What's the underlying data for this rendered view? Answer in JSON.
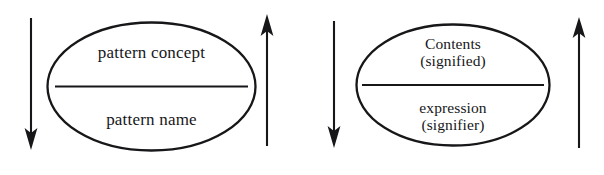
{
  "figure": {
    "background_color": "#ffffff",
    "ink_color": "#17171a",
    "width": 604,
    "height": 175
  },
  "units": [
    {
      "id": "pattern-unit",
      "ellipse": {
        "top_compartment": {
          "lines": [
            "pattern concept"
          ]
        },
        "bottom_compartment": {
          "lines": [
            "pattern name"
          ]
        }
      },
      "arrows": [
        {
          "name": "left-down-arrow",
          "direction": "down"
        },
        {
          "name": "right-up-arrow",
          "direction": "up"
        }
      ]
    },
    {
      "id": "sign-unit",
      "ellipse": {
        "top_compartment": {
          "lines": [
            "Contents",
            "(signified)"
          ]
        },
        "bottom_compartment": {
          "lines": [
            "expression",
            "(signifier)"
          ]
        }
      },
      "arrows": [
        {
          "name": "left-down-arrow",
          "direction": "down"
        },
        {
          "name": "right-up-arrow",
          "direction": "up"
        }
      ]
    }
  ]
}
